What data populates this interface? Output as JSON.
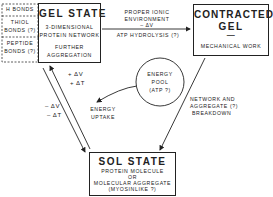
{
  "bonds": {
    "items": [
      "H BONDS",
      "THIOL",
      "BONDS (?)",
      "PEPTIDE",
      "BONDS (?)"
    ]
  },
  "gel_state": {
    "title": "GEL STATE",
    "line1": "3-DIMENSIONAL",
    "line2": "PROTEIN NETWORK",
    "line3": "FURTHER",
    "line4": "AGGREGATION"
  },
  "contracted_gel": {
    "title1": "CONTRACTED",
    "title2": "GEL",
    "dash": "—",
    "line1": "MECHANICAL  WORK"
  },
  "sol_state": {
    "title": "SOL STATE",
    "line1": "PROTEIN  MOLECULE",
    "line2": "OR",
    "line3": "MOLECULAR AGGREGATE",
    "line4": "(MYOSINLIKE ?)"
  },
  "gel_to_contracted": {
    "above1": "PROPER  IONIC",
    "above2": "ENVIRONMENT",
    "above3": "– ΔV",
    "below": "ATP  HYDROLYSIS (?)"
  },
  "sol_to_gel": {
    "label1": "+ ΔV",
    "label2": "+ ΔT"
  },
  "gel_to_sol": {
    "label1": "– ΔV",
    "label2": "– ΔT"
  },
  "energy": {
    "pool1": "ENERGY",
    "pool2": "POOL",
    "pool3": "(ATP ?)",
    "uptake1": "ENERGY",
    "uptake2": "UPTAKE"
  },
  "contracted_to_sol": {
    "line1": "NETWORK  AND",
    "line2": "AGGREGATE (?)",
    "line3": "BREAKDOWN"
  }
}
